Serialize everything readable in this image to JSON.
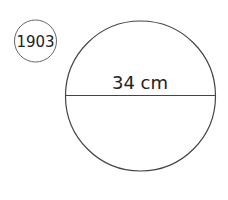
{
  "problem_number": "1903",
  "figure": {
    "shape": "circle",
    "diameter_label": "34 cm",
    "stroke_color": "#444444",
    "fill_color": "#ffffff"
  }
}
